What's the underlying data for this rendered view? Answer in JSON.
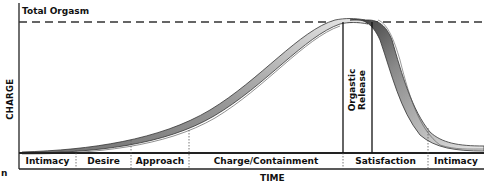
{
  "diagram": {
    "top_line_label": "Total Orgasm",
    "y_axis_label": "CHARGE",
    "x_axis_label": "TIME",
    "release_label": "Orgastic Release",
    "stray_glyph": "n",
    "phases": [
      {
        "label": "Intimacy"
      },
      {
        "label": "Desire"
      },
      {
        "label": "Approach"
      },
      {
        "label": "Charge/Containment"
      },
      {
        "label": "Satisfaction"
      },
      {
        "label": "Intimacy"
      }
    ],
    "colors": {
      "line": "#222222",
      "band_light": "#e4e4e4",
      "band_dark": "#8a8a8a",
      "background": "#ffffff"
    }
  }
}
